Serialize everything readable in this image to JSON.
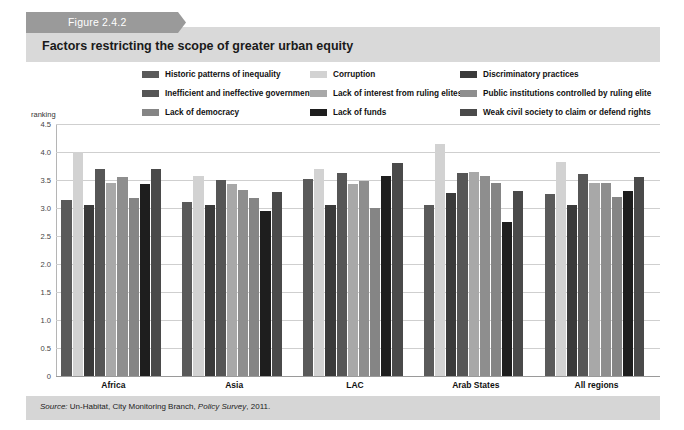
{
  "figure": {
    "tab_label": "Figure 2.4.2",
    "title": "Factors restricting the scope of greater urban equity",
    "source": "Source: Un-Habitat, City Monitoring Branch, Policy Survey, 2011.",
    "source_prefix": "Source:",
    "source_rest": " Un-Habitat, City Monitoring Branch, ",
    "source_italic2": "Policy Survey",
    "source_tail": ", 2011."
  },
  "legend": {
    "items": [
      {
        "label": "Historic patterns of inequality",
        "color": "#5a5a5a",
        "col": 0,
        "row": 0
      },
      {
        "label": "Corruption",
        "color": "#d2d2d2",
        "col": 1,
        "row": 0
      },
      {
        "label": "Discriminatory practices",
        "color": "#3a3a3a",
        "col": 2,
        "row": 0
      },
      {
        "label": "Inefficient and ineffective government",
        "color": "#565656",
        "col": 0,
        "row": 1
      },
      {
        "label": "Lack of interest from ruling elites",
        "color": "#a8a8a8",
        "col": 1,
        "row": 1
      },
      {
        "label": "Public institutions controlled by ruling elite",
        "color": "#8e8e8e",
        "col": 2,
        "row": 1
      },
      {
        "label": "Lack of democracy",
        "color": "#858585",
        "col": 0,
        "row": 2
      },
      {
        "label": "Lack of funds",
        "color": "#1e1e1e",
        "col": 1,
        "row": 2
      },
      {
        "label": "Weak civil society to claim or defend rights",
        "color": "#4a4a4a",
        "col": 2,
        "row": 2
      }
    ]
  },
  "axis": {
    "ylabel": "ranking",
    "yticks": [
      "4.5",
      "4.0",
      "3.5",
      "3.0",
      "2.5",
      "2.0",
      "1.5",
      "1.0",
      "0.5",
      "0"
    ]
  },
  "chart_data": {
    "type": "bar",
    "title": "Factors restricting the scope of greater urban equity",
    "xlabel": "",
    "ylabel": "ranking",
    "ylim": [
      0,
      4.5
    ],
    "ytick_step": 0.5,
    "grid": true,
    "legend_position": "top",
    "categories": [
      "Africa",
      "Asia",
      "LAC",
      "Arab States",
      "All regions"
    ],
    "series": [
      {
        "name": "Historic patterns of inequality",
        "color": "#5a5a5a",
        "values": [
          3.15,
          3.1,
          3.52,
          3.05,
          3.25
        ]
      },
      {
        "name": "Corruption",
        "color": "#d2d2d2",
        "values": [
          4.0,
          3.58,
          3.7,
          4.15,
          3.82
        ]
      },
      {
        "name": "Discriminatory practices",
        "color": "#3a3a3a",
        "values": [
          3.05,
          3.05,
          3.06,
          3.27,
          3.05
        ]
      },
      {
        "name": "Inefficient and ineffective government",
        "color": "#565656",
        "values": [
          3.7,
          3.5,
          3.62,
          3.62,
          3.6
        ]
      },
      {
        "name": "Lack of interest from ruling elites",
        "color": "#a8a8a8",
        "values": [
          3.45,
          3.43,
          3.42,
          3.65,
          3.45
        ]
      },
      {
        "name": "Public institutions controlled by ruling elite",
        "color": "#8e8e8e",
        "values": [
          3.55,
          3.33,
          3.48,
          3.57,
          3.45
        ]
      },
      {
        "name": "Lack of democracy",
        "color": "#858585",
        "values": [
          3.18,
          3.18,
          3.0,
          3.45,
          3.2
        ]
      },
      {
        "name": "Lack of funds",
        "color": "#1e1e1e",
        "values": [
          3.42,
          2.95,
          3.57,
          2.75,
          3.3
        ]
      },
      {
        "name": "Weak civil society to claim or defend rights",
        "color": "#4a4a4a",
        "values": [
          3.7,
          3.28,
          3.8,
          3.3,
          3.55
        ]
      }
    ]
  }
}
